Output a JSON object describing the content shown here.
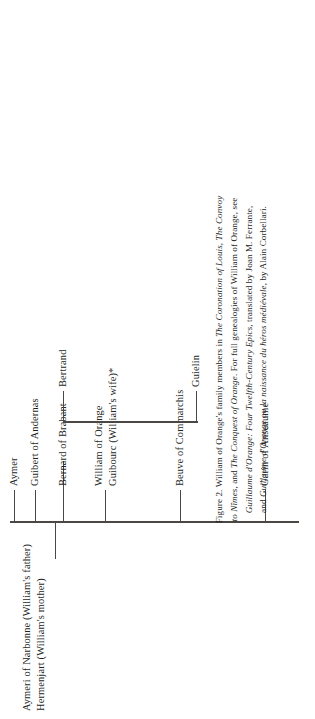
{
  "figure": {
    "parents": {
      "father": "Aymeri of Narbonne (William's father)",
      "mother": "Hermenjart (William's mother)"
    },
    "nodes": [
      {
        "id": "garin",
        "label": "Garin of Anseaume"
      },
      {
        "id": "beuve",
        "label": "Beuve of Commarchis"
      },
      {
        "id": "william",
        "label": "William of Orange",
        "sublabel": "Guibourc (William's wife)*",
        "bold": true
      },
      {
        "id": "bernard",
        "label": "Bernard of Brabant"
      },
      {
        "id": "guibert",
        "label": "Guibert of Andernas"
      },
      {
        "id": "aymer",
        "label": "Aymer"
      }
    ],
    "children": [
      {
        "id": "guielin",
        "label": "Guielin"
      },
      {
        "id": "bertrand",
        "label": "Bertrand"
      }
    ],
    "rule_color": "#4b4745"
  },
  "caption": {
    "lines": [
      [
        {
          "text": "Figure 2. William of Orange's family members in ",
          "italic": false
        },
        {
          "text": "The Coronation of Louis",
          "italic": true
        },
        {
          "text": ", ",
          "italic": false
        },
        {
          "text": "The Convoy",
          "italic": true
        }
      ],
      [
        {
          "text": "to Nîmes",
          "italic": true
        },
        {
          "text": ", and ",
          "italic": false
        },
        {
          "text": "The Conquest of Orange",
          "italic": true
        },
        {
          "text": ". For full genealogies of William of Orange, see",
          "italic": false
        }
      ],
      [
        {
          "text": "Guillaume d'Orange: Four Twelfth-Century Epics",
          "italic": true
        },
        {
          "text": ", translated by Joan M. Ferrante,",
          "italic": false
        }
      ],
      [
        {
          "text": "and ",
          "italic": false
        },
        {
          "text": "Guillaume d'Orange ou la naissance du héros médiévale",
          "italic": true
        },
        {
          "text": ", by Alain Corbellari.",
          "italic": false
        }
      ]
    ]
  }
}
